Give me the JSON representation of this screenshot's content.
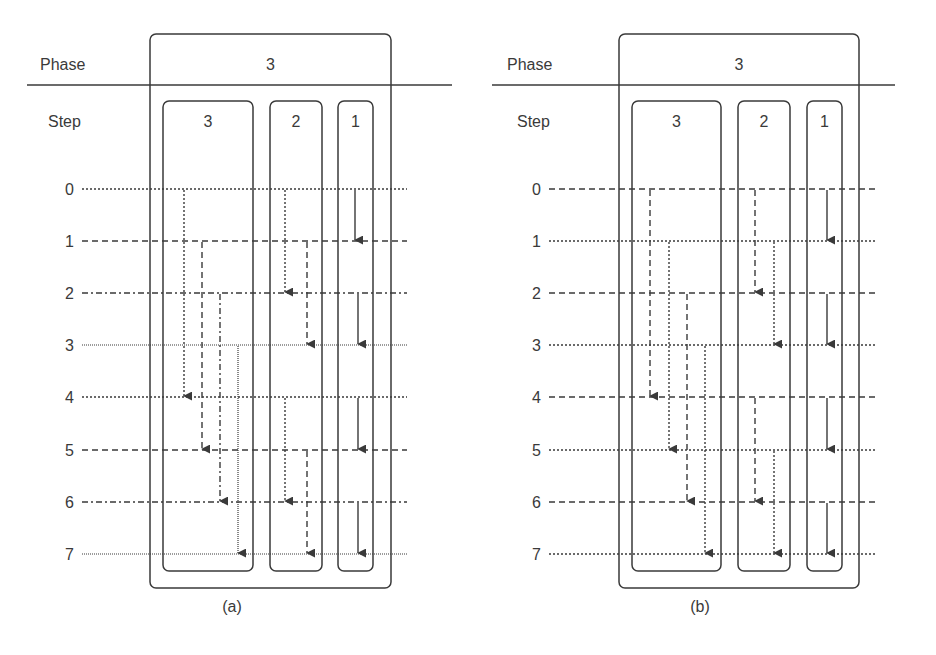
{
  "colors": {
    "ink": "#3a3a3a",
    "background": "#ffffff"
  },
  "labels": {
    "phase": "Phase",
    "step": "Step"
  },
  "step_values": [
    "0",
    "1",
    "2",
    "3",
    "4",
    "5",
    "6",
    "7"
  ],
  "step_y": [
    189,
    241,
    293,
    345,
    397,
    450,
    502,
    554
  ],
  "diagrams": [
    {
      "id": "a",
      "caption": "(a)",
      "caption_x": 232,
      "caption_y": 612,
      "phase_label_x": 40,
      "step_label_x": 48,
      "rule": {
        "x1": 27,
        "x2": 452,
        "y": 85
      },
      "step_num_x": 74,
      "line_x1": 82,
      "line_x2": 407,
      "line_styles": [
        "dotted",
        "dashed",
        "dashdot",
        "finedot",
        "dotted",
        "dashed",
        "dashdot",
        "finedot"
      ],
      "phase": {
        "label": "3",
        "x": 150,
        "y": 34,
        "w": 241,
        "h": 554
      },
      "steps": [
        {
          "label": "3",
          "x": 163,
          "y": 101,
          "w": 90,
          "h": 470,
          "arrows": [
            {
              "x": 184,
              "from": 0,
              "to": 4
            },
            {
              "x": 202,
              "from": 1,
              "to": 5
            },
            {
              "x": 220,
              "from": 2,
              "to": 6
            },
            {
              "x": 238,
              "from": 3,
              "to": 7
            }
          ]
        },
        {
          "label": "2",
          "x": 270,
          "y": 101,
          "w": 52,
          "h": 470,
          "arrows": [
            {
              "x": 285,
              "from": 0,
              "to": 2
            },
            {
              "x": 307,
              "from": 1,
              "to": 3
            },
            {
              "x": 285,
              "from": 4,
              "to": 6
            },
            {
              "x": 307,
              "from": 5,
              "to": 7
            }
          ]
        },
        {
          "label": "1",
          "x": 338,
          "y": 101,
          "w": 35,
          "h": 470,
          "arrows": [
            {
              "x": 355,
              "from": 0,
              "to": 1,
              "style": "solid"
            },
            {
              "x": 358,
              "from": 2,
              "to": 3,
              "style": "solid"
            },
            {
              "x": 358,
              "from": 4,
              "to": 5,
              "style": "solid"
            },
            {
              "x": 358,
              "from": 6,
              "to": 7,
              "style": "solid"
            }
          ]
        }
      ],
      "arrow_style_rule": "step3 arrows inherit style of originating step line; step2 and step1 solid"
    },
    {
      "id": "b",
      "caption": "(b)",
      "caption_x": 700,
      "caption_y": 612,
      "phase_label_x": 507,
      "step_label_x": 517,
      "rule": {
        "x1": 492,
        "x2": 895,
        "y": 85
      },
      "step_num_x": 541,
      "line_x1": 549,
      "line_x2": 875,
      "line_styles": [
        "dashed",
        "dotted",
        "dashed",
        "dotted",
        "dashed",
        "dotted",
        "dashed",
        "dotted"
      ],
      "phase": {
        "label": "3",
        "x": 619,
        "y": 34,
        "w": 240,
        "h": 554
      },
      "steps": [
        {
          "label": "3",
          "x": 632,
          "y": 101,
          "w": 89,
          "h": 470,
          "arrows": [
            {
              "x": 650,
              "from": 0,
              "to": 4
            },
            {
              "x": 669,
              "from": 1,
              "to": 5
            },
            {
              "x": 687,
              "from": 2,
              "to": 6
            },
            {
              "x": 705,
              "from": 3,
              "to": 7
            }
          ]
        },
        {
          "label": "2",
          "x": 738,
          "y": 101,
          "w": 52,
          "h": 470,
          "arrows": [
            {
              "x": 755,
              "from": 0,
              "to": 2
            },
            {
              "x": 774,
              "from": 1,
              "to": 3
            },
            {
              "x": 755,
              "from": 4,
              "to": 6
            },
            {
              "x": 774,
              "from": 5,
              "to": 7
            }
          ]
        },
        {
          "label": "1",
          "x": 807,
          "y": 101,
          "w": 35,
          "h": 470,
          "arrows": [
            {
              "x": 827,
              "from": 0,
              "to": 1,
              "style": "solid"
            },
            {
              "x": 827,
              "from": 2,
              "to": 3,
              "style": "solid"
            },
            {
              "x": 827,
              "from": 4,
              "to": 5,
              "style": "solid"
            },
            {
              "x": 827,
              "from": 6,
              "to": 7,
              "style": "solid"
            }
          ]
        }
      ],
      "arrow_style_rule": "step3 and step2 arrows inherit style of originating step line; step1 solid"
    }
  ]
}
